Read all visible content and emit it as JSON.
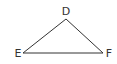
{
  "diagram": {
    "type": "triangle",
    "stroke_color": "#333333",
    "vertices": [
      {
        "label": "D",
        "position": "top"
      },
      {
        "label": "E",
        "position": "bottom-left"
      },
      {
        "label": "F",
        "position": "bottom-right"
      }
    ],
    "edges": [
      "DE",
      "EF",
      "DF"
    ]
  }
}
